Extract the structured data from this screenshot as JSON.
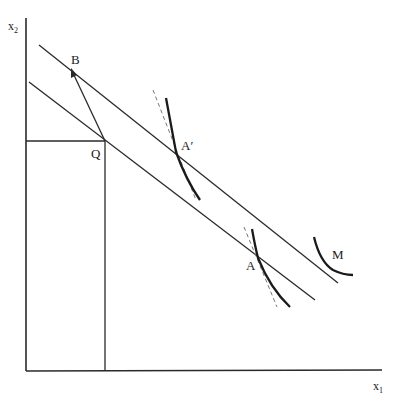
{
  "diagram": {
    "type": "economics-indifference-diagram",
    "axes": {
      "y_label": "x",
      "y_label_sub": "2",
      "x_label": "x",
      "x_label_sub": "1"
    },
    "points": {
      "Q": "Q",
      "B": "B",
      "A_prime": "A′",
      "A": "A",
      "M": "M"
    },
    "colors": {
      "line": "#2a2a2a",
      "dashed": "#777777",
      "background": "#ffffff"
    }
  }
}
